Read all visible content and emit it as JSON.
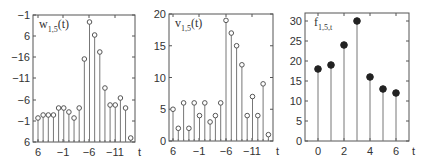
{
  "chart_data": [
    {
      "type": "stem",
      "title": "w",
      "title_sub": "1,5",
      "title_suffix": "(t)",
      "xlabel": "t",
      "box": {
        "left": 33,
        "right": 135,
        "top": 15,
        "bottom": 142
      },
      "yticks": [
        {
          "label": "-1",
          "y": 15
        },
        {
          "label": "6",
          "y": 36
        },
        {
          "label": "-16",
          "y": 57
        },
        {
          "label": "-11",
          "y": 78
        },
        {
          "label": "-6",
          "y": 100
        },
        {
          "label": "-1",
          "y": 121
        },
        {
          "label": "6",
          "y": 142
        }
      ],
      "xticks": [
        {
          "label": "6",
          "x": 38
        },
        {
          "label": "-1",
          "x": 63
        },
        {
          "label": "-6",
          "x": 89
        },
        {
          "label": "-11",
          "x": 115
        }
      ],
      "marker": "open",
      "x_start": 38,
      "x_step": 5.15,
      "point_y": [
        118,
        115,
        115,
        115,
        108,
        108,
        112,
        118,
        108,
        59,
        22,
        35,
        52,
        88,
        105,
        105,
        98,
        108,
        138
      ]
    },
    {
      "type": "stem",
      "title": "v",
      "title_sub": "1,5",
      "title_suffix": "(t)",
      "xlabel": "t",
      "box": {
        "left": 169,
        "right": 273,
        "top": 14,
        "bottom": 141
      },
      "ylim": [
        0,
        20
      ],
      "yticks": [
        {
          "label": "0",
          "value": 0
        },
        {
          "label": "5",
          "value": 5
        },
        {
          "label": "10",
          "value": 10
        },
        {
          "label": "15",
          "value": 15
        },
        {
          "label": "20",
          "value": 20
        }
      ],
      "xticks": [
        {
          "label": "6",
          "x": 173
        },
        {
          "label": "-1",
          "x": 199
        },
        {
          "label": "-6",
          "x": 226
        },
        {
          "label": "-11",
          "x": 252
        }
      ],
      "marker": "open",
      "x_start": 173,
      "x_step": 5.3,
      "values": [
        5,
        2,
        6,
        2,
        6,
        4,
        6,
        3,
        4,
        6,
        19,
        17,
        15,
        12,
        4,
        7,
        4,
        9,
        1
      ]
    },
    {
      "type": "stem",
      "title": "f",
      "title_sub": "1,5,t",
      "title_suffix": "",
      "xlabel": "t",
      "box": {
        "left": 305,
        "right": 409,
        "top": 13,
        "bottom": 141
      },
      "ylim": [
        0,
        32
      ],
      "xlim": [
        -1,
        7
      ],
      "yticks": [
        {
          "label": "0",
          "value": 0
        },
        {
          "label": "5",
          "value": 5
        },
        {
          "label": "10",
          "value": 10
        },
        {
          "label": "15",
          "value": 15
        },
        {
          "label": "20",
          "value": 20
        },
        {
          "label": "25",
          "value": 25
        },
        {
          "label": "30",
          "value": 30
        }
      ],
      "xticks": [
        {
          "label": "0",
          "value": 0
        },
        {
          "label": "2",
          "value": 2
        },
        {
          "label": "4",
          "value": 4
        },
        {
          "label": "6",
          "value": 6
        }
      ],
      "marker": "filled",
      "x": [
        0,
        1,
        2,
        3,
        4,
        5,
        6
      ],
      "values": [
        18,
        19,
        24,
        30,
        16,
        13,
        12
      ]
    }
  ]
}
